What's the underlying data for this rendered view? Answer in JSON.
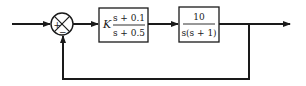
{
  "diagram": {
    "type": "block-diagram",
    "summing_junction": {
      "signs": {
        "top_left": "+",
        "bottom": "−"
      }
    },
    "blocks": [
      {
        "id": "controller",
        "gain_symbol": "K",
        "numerator": "s + 0.1",
        "denominator": "s + 0.5"
      },
      {
        "id": "plant",
        "numerator": "10",
        "denominator": "s(s + 1)"
      }
    ],
    "colors": {
      "line": "#1a1a1a",
      "background": "#ffffff"
    }
  }
}
